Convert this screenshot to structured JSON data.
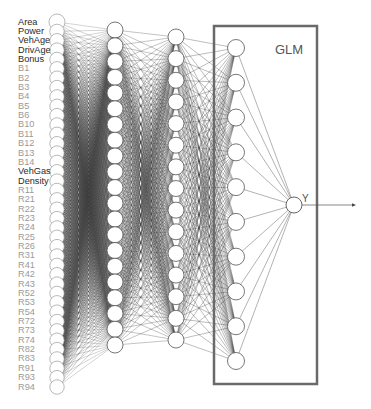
{
  "diagram": {
    "input_features": [
      {
        "label": "Area",
        "emphasis": "dark"
      },
      {
        "label": "Power",
        "emphasis": "dark"
      },
      {
        "label": "VehAge",
        "emphasis": "dark"
      },
      {
        "label": "DrivAge",
        "emphasis": "dark"
      },
      {
        "label": "Bonus",
        "emphasis": "dark"
      },
      {
        "label": "B1",
        "emphasis": "light"
      },
      {
        "label": "B2",
        "emphasis": "light"
      },
      {
        "label": "B3",
        "emphasis": "light"
      },
      {
        "label": "B4",
        "emphasis": "light"
      },
      {
        "label": "B5",
        "emphasis": "light"
      },
      {
        "label": "B6",
        "emphasis": "light"
      },
      {
        "label": "B10",
        "emphasis": "light"
      },
      {
        "label": "B11",
        "emphasis": "light"
      },
      {
        "label": "B12",
        "emphasis": "light"
      },
      {
        "label": "B13",
        "emphasis": "light"
      },
      {
        "label": "B14",
        "emphasis": "light"
      },
      {
        "label": "VehGas",
        "emphasis": "dark"
      },
      {
        "label": "Density",
        "emphasis": "dark"
      },
      {
        "label": "R11",
        "emphasis": "light"
      },
      {
        "label": "R21",
        "emphasis": "light"
      },
      {
        "label": "R22",
        "emphasis": "light"
      },
      {
        "label": "R23",
        "emphasis": "light"
      },
      {
        "label": "R24",
        "emphasis": "light"
      },
      {
        "label": "R25",
        "emphasis": "light"
      },
      {
        "label": "R26",
        "emphasis": "light"
      },
      {
        "label": "R31",
        "emphasis": "light"
      },
      {
        "label": "R41",
        "emphasis": "light"
      },
      {
        "label": "R42",
        "emphasis": "light"
      },
      {
        "label": "R43",
        "emphasis": "light"
      },
      {
        "label": "R52",
        "emphasis": "light"
      },
      {
        "label": "R53",
        "emphasis": "light"
      },
      {
        "label": "R54",
        "emphasis": "light"
      },
      {
        "label": "R72",
        "emphasis": "light"
      },
      {
        "label": "R73",
        "emphasis": "light"
      },
      {
        "label": "R74",
        "emphasis": "light"
      },
      {
        "label": "R82",
        "emphasis": "light"
      },
      {
        "label": "R83",
        "emphasis": "light"
      },
      {
        "label": "R91",
        "emphasis": "light"
      },
      {
        "label": "R93",
        "emphasis": "light"
      },
      {
        "label": "R94",
        "emphasis": "light"
      }
    ],
    "hidden_layers": [
      {
        "name": "hidden-1",
        "nodes": 21,
        "x": 115,
        "y_top": 30,
        "y_bottom": 345
      },
      {
        "name": "hidden-2",
        "nodes": 15,
        "x": 176,
        "y_top": 37,
        "y_bottom": 340
      },
      {
        "name": "hidden-3",
        "nodes": 10,
        "x": 236,
        "y_top": 48,
        "y_bottom": 361
      }
    ],
    "glm_box": {
      "label": "GLM",
      "x": 214,
      "y": 26,
      "width": 103,
      "height": 358
    },
    "output": {
      "label": "Y",
      "x": 294,
      "y": 205,
      "r": 8
    },
    "arrow": {
      "x1": 302,
      "y1": 205,
      "x2": 356,
      "y2": 205
    },
    "colors": {
      "edge": "#3a3a3a",
      "node_fill": "#ffffff",
      "node_stroke": "#555555",
      "box": "#6a6a6a",
      "label_dark": "#2a2a2a",
      "label_light": "#9a9a9a"
    }
  }
}
